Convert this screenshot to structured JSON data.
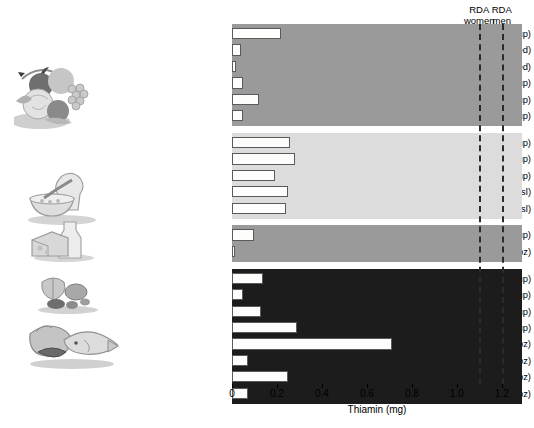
{
  "chart_data": {
    "type": "bar",
    "orientation": "horizontal",
    "title": "",
    "xlabel": "Thiamin (mg)",
    "ylabel": "",
    "xlim": [
      0,
      1.29
    ],
    "xticks": [
      0,
      0.2,
      0.4,
      0.6,
      0.8,
      1.0,
      1.2
    ],
    "xticklabels": [
      "0",
      "0.2",
      "0.4",
      "0.6",
      "0.8",
      "1.0",
      "1.2"
    ],
    "grid": false,
    "legend": "none",
    "categories": [
      "Orange juice, 250 mL (1 cup)",
      "Kiwi (2 med)",
      "Apple (1 med)",
      "Corn, 125 mL (1/2 cup)",
      "Asparagus, 125 mL (1/2 cup)",
      "Spinach, raw, 250 mL (1 cup)",
      "Oatmeal, 250 mL (1 cup)",
      "Spaghetti, 250 mL (1 cup)",
      "Brown rice, 250 mL (1 cup)",
      "White bread (2 sl)",
      "Whole-wheat bread (2 sl)",
      "2% Milk, 250 mL (1 cup)",
      "Cheddar cheese, 42 g (1.5 oz)",
      "Sunflower seeds, 60 mL (1/4 cup)",
      "Walnuts, 60 mL (1/4 cup)",
      "Peanuts, 60 mL (1/4 cup)",
      "Lentils, 250 mL (1 cup)",
      "Pork, 85 g (3 oz)",
      "Beef, 85 g (3 oz)",
      "Trout, 85 g (3 oz)",
      "Chicken, 85 g (3 oz)"
    ],
    "values": [
      0.22,
      0.04,
      0.02,
      0.05,
      0.12,
      0.05,
      0.26,
      0.28,
      0.19,
      0.25,
      0.24,
      0.1,
      0.01,
      0.14,
      0.05,
      0.13,
      0.29,
      0.71,
      0.07,
      0.25,
      0.07
    ],
    "groups": [
      {
        "name": "fruits-vegetables",
        "start": 0,
        "count": 6,
        "band_color": "#9a9a9a"
      },
      {
        "name": "grains",
        "start": 6,
        "count": 5,
        "band_color": "#dcdcdc"
      },
      {
        "name": "dairy",
        "start": 11,
        "count": 2,
        "band_color": "#9a9a9a"
      },
      {
        "name": "protein-foods",
        "start": 13,
        "count": 8,
        "band_color": "#1c1c1c"
      }
    ],
    "reference_lines": [
      {
        "label_line1": "RDA",
        "label_line2": "women",
        "value": 1.1
      },
      {
        "label_line1": "RDA",
        "label_line2": "men",
        "value": 1.2
      }
    ],
    "bar_fill_color": "#fdfdfb",
    "bar_edge_color": "#5a5a5a"
  },
  "illustrations": [
    {
      "name": "fruits-and-vegetables-illustration"
    },
    {
      "name": "grains-and-bread-illustration"
    },
    {
      "name": "milk-and-cheese-illustration"
    },
    {
      "name": "nuts-and-seeds-illustration"
    },
    {
      "name": "meat-fish-poultry-illustration"
    }
  ]
}
